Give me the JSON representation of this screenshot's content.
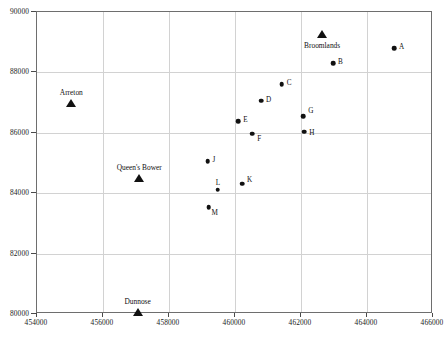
{
  "chart_data": {
    "type": "scatter",
    "title": "",
    "xlabel": "",
    "ylabel": "",
    "xlim": [
      454000,
      466000
    ],
    "ylim": [
      80000,
      90000
    ],
    "xticks": [
      454000,
      456000,
      458000,
      460000,
      462000,
      464000,
      466000
    ],
    "yticks": [
      80000,
      82000,
      84000,
      86000,
      88000,
      90000
    ],
    "xtick_labels": [
      "454000",
      "456000",
      "458000",
      "460000",
      "462000",
      "464000",
      "466000"
    ],
    "ytick_labels": [
      "80000",
      "82000",
      "84000",
      "86000",
      "88000",
      "90000"
    ],
    "grid": true,
    "legend": "none",
    "series": [
      {
        "name": "sample-points",
        "marker": "filled-circle",
        "color": "#111111",
        "points": [
          {
            "label": "A",
            "x": 464850,
            "y": 88760,
            "label_dx": 5,
            "label_dy": -1
          },
          {
            "label": "B",
            "x": 463000,
            "y": 88270,
            "label_dx": 5,
            "label_dy": -1
          },
          {
            "label": "C",
            "x": 461450,
            "y": 87580,
            "label_dx": 5,
            "label_dy": -1
          },
          {
            "label": "D",
            "x": 460820,
            "y": 87030,
            "label_dx": 5,
            "label_dy": -1
          },
          {
            "label": "E",
            "x": 460130,
            "y": 86350,
            "label_dx": 5,
            "label_dy": -1
          },
          {
            "label": "F",
            "x": 460550,
            "y": 85940,
            "label_dx": 5,
            "label_dy": 5
          },
          {
            "label": "G",
            "x": 462100,
            "y": 86520,
            "label_dx": 5,
            "label_dy": -5
          },
          {
            "label": "H",
            "x": 462130,
            "y": 86000,
            "label_dx": 5,
            "label_dy": 1
          },
          {
            "label": "J",
            "x": 459200,
            "y": 85020,
            "label_dx": 5,
            "label_dy": -1
          },
          {
            "label": "K",
            "x": 460240,
            "y": 84280,
            "label_dx": 5,
            "label_dy": -4
          },
          {
            "label": "L",
            "x": 459510,
            "y": 84080,
            "label_dx": -2,
            "label_dy": -7
          },
          {
            "label": "M",
            "x": 459230,
            "y": 83500,
            "label_dx": 3,
            "label_dy": 6
          }
        ]
      },
      {
        "name": "named-sites",
        "marker": "filled-triangle",
        "color": "#111111",
        "points": [
          {
            "label": "Arreton",
            "x": 455070,
            "y": 86960,
            "label_pos": "above"
          },
          {
            "label": "Broomlands",
            "x": 462670,
            "y": 89250,
            "label_pos": "below"
          },
          {
            "label": "Queen's Bower",
            "x": 457130,
            "y": 84480,
            "label_pos": "above"
          },
          {
            "label": "Dunnose",
            "x": 457080,
            "y": 80040,
            "label_pos": "above"
          }
        ]
      }
    ]
  }
}
